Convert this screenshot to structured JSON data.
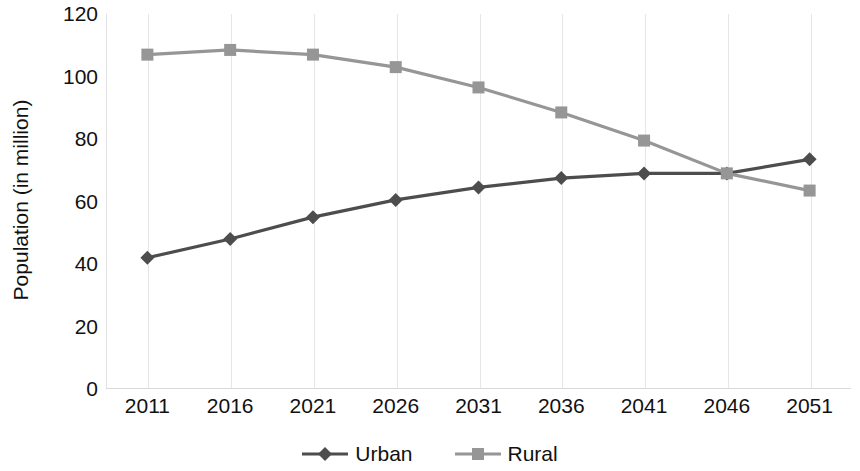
{
  "chart_data": {
    "type": "line",
    "title": "",
    "xlabel": "",
    "ylabel": "Population (in million)",
    "categories": [
      "2011",
      "2016",
      "2021",
      "2026",
      "2031",
      "2036",
      "2041",
      "2046",
      "2051"
    ],
    "x": [
      2011,
      2016,
      2021,
      2026,
      2031,
      2036,
      2041,
      2046,
      2051
    ],
    "series": [
      {
        "name": "Urban",
        "color": "#4d4d4d",
        "marker": "diamond",
        "values": [
          42,
          48,
          55,
          60.5,
          64.5,
          67.5,
          69,
          69,
          73.5
        ]
      },
      {
        "name": "Rural",
        "color": "#969696",
        "marker": "square",
        "values": [
          107,
          108.5,
          107,
          103,
          96.5,
          88.5,
          79.5,
          69,
          63.5
        ]
      }
    ],
    "ylim": [
      0,
      120
    ],
    "yticks": [
      0,
      20,
      40,
      60,
      80,
      100,
      120
    ],
    "ytick_labels": [
      "0",
      "20",
      "40",
      "60",
      "80",
      "100",
      "120"
    ],
    "grid": {
      "vertical": true,
      "horizontal": false,
      "color": "#e6e6e6"
    },
    "legend": {
      "position": "bottom",
      "entries": [
        {
          "label": "Urban",
          "color": "#4d4d4d",
          "marker": "diamond"
        },
        {
          "label": "Rural",
          "color": "#969696",
          "marker": "square"
        }
      ]
    }
  }
}
